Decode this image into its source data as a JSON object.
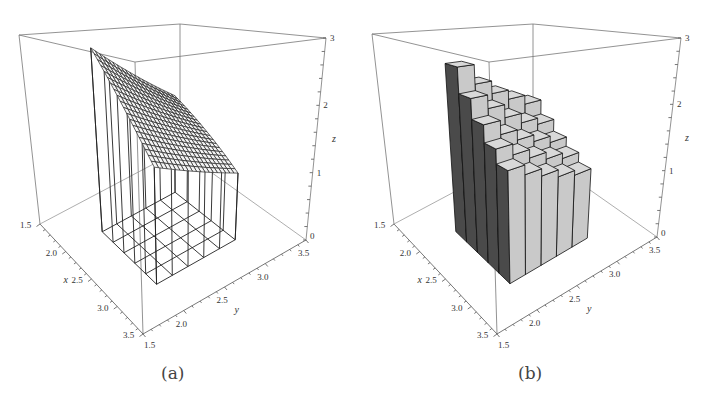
{
  "panels": [
    {
      "id": "a",
      "caption": "(a)"
    },
    {
      "id": "b",
      "caption": "(b)"
    }
  ],
  "chart_data": [
    {
      "type": "surface",
      "title": "(a)",
      "xlabel": "x",
      "ylabel": "y",
      "zlabel": "z",
      "xlim": [
        1.5,
        3.5
      ],
      "ylim": [
        1.5,
        3.5
      ],
      "zlim": [
        0,
        3
      ],
      "xticks": [
        "1.5",
        "2.0",
        "2.5",
        "3.0",
        "3.5"
      ],
      "yticks": [
        "1.5",
        "2.0",
        "2.5",
        "3.0",
        "3.5"
      ],
      "zticks": [
        "0",
        "1",
        "2",
        "3"
      ],
      "surface_domain": {
        "x": [
          2.0,
          3.0
        ],
        "y": [
          2.0,
          3.0
        ]
      },
      "surface_description": "mesh surface decreasing in z with increasing x and y; z approx 2.5 at (2,2) down to approx 1.0 at (3,3)",
      "z_corners": {
        "x2y2": 2.6,
        "x2y3": 1.8,
        "x3y2": 1.5,
        "x3y3": 1.0
      },
      "base_grid_cells": 5
    },
    {
      "type": "bar3d",
      "title": "(b)",
      "xlabel": "x",
      "ylabel": "y",
      "zlabel": "z",
      "xlim": [
        1.5,
        3.5
      ],
      "ylim": [
        1.5,
        3.5
      ],
      "zlim": [
        0,
        3
      ],
      "xticks": [
        "1.5",
        "2.0",
        "2.5",
        "3.0",
        "3.5"
      ],
      "yticks": [
        "1.5",
        "2.0",
        "2.5",
        "3.0",
        "3.5"
      ],
      "zticks": [
        "0",
        "1",
        "2",
        "3"
      ],
      "x_bins": [
        2.0,
        2.2,
        2.4,
        2.6,
        2.8,
        3.0
      ],
      "y_bins": [
        2.0,
        2.2,
        2.4,
        2.6,
        2.8,
        3.0
      ],
      "heights": [
        [
          2.6,
          2.3,
          2.1,
          1.95,
          1.8
        ],
        [
          2.2,
          2.0,
          1.8,
          1.65,
          1.55
        ],
        [
          1.9,
          1.7,
          1.55,
          1.45,
          1.35
        ],
        [
          1.65,
          1.5,
          1.38,
          1.28,
          1.2
        ],
        [
          1.45,
          1.32,
          1.22,
          1.12,
          1.05
        ]
      ]
    }
  ],
  "axes_labels": {
    "x": "x",
    "y": "y",
    "z": "z"
  }
}
